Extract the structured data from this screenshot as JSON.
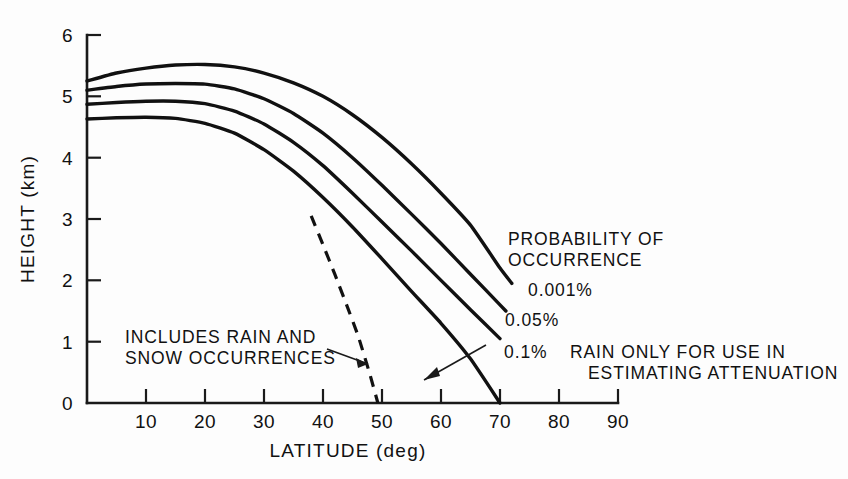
{
  "chart_data": {
    "type": "line",
    "title": "",
    "xlabel": "LATITUDE  (deg)",
    "ylabel": "HEIGHT  (km)",
    "xlim": [
      0,
      90
    ],
    "ylim": [
      0,
      6
    ],
    "xticks": [
      0,
      10,
      20,
      30,
      40,
      50,
      60,
      70,
      80,
      90
    ],
    "xtick_labels": [
      "0",
      "10",
      "20",
      "30",
      "40",
      "50",
      "60",
      "70",
      "80",
      "90"
    ],
    "yticks": [
      0,
      1,
      2,
      3,
      4,
      5,
      6
    ],
    "ytick_labels": [
      "0",
      "1",
      "2",
      "3",
      "4",
      "5",
      "6"
    ],
    "grid": false,
    "legend_position": "inline-right-annotations",
    "series": [
      {
        "name": "0.001%",
        "style": "solid",
        "x": [
          0,
          5,
          10,
          15,
          20,
          25,
          30,
          35,
          40,
          45,
          50,
          55,
          60,
          65,
          70,
          72
        ],
        "y": [
          5.25,
          5.38,
          5.46,
          5.51,
          5.52,
          5.48,
          5.38,
          5.22,
          5.0,
          4.7,
          4.33,
          3.9,
          3.42,
          2.9,
          2.2,
          1.95
        ]
      },
      {
        "name": "0.05%",
        "style": "solid",
        "x": [
          0,
          5,
          10,
          15,
          20,
          25,
          30,
          35,
          40,
          45,
          50,
          55,
          60,
          65,
          70,
          71
        ],
        "y": [
          5.1,
          5.16,
          5.2,
          5.21,
          5.2,
          5.12,
          4.96,
          4.72,
          4.4,
          4.0,
          3.55,
          3.08,
          2.6,
          2.1,
          1.6,
          1.5
        ]
      },
      {
        "name": "0.1%",
        "style": "solid",
        "x": [
          0,
          5,
          10,
          15,
          20,
          25,
          30,
          35,
          40,
          45,
          50,
          55,
          60,
          65,
          70
        ],
        "y": [
          4.87,
          4.9,
          4.92,
          4.92,
          4.88,
          4.76,
          4.55,
          4.25,
          3.87,
          3.42,
          2.95,
          2.48,
          2.0,
          1.52,
          1.05
        ]
      },
      {
        "name": "lowest",
        "style": "solid",
        "x": [
          0,
          5,
          10,
          15,
          20,
          25,
          30,
          35,
          40,
          45,
          50,
          55,
          60,
          65,
          70
        ],
        "y": [
          4.63,
          4.65,
          4.66,
          4.64,
          4.56,
          4.4,
          4.13,
          3.78,
          3.35,
          2.87,
          2.35,
          1.82,
          1.3,
          0.72,
          0.0
        ]
      },
      {
        "name": "includes-rain-and-snow",
        "style": "dashed",
        "x": [
          38,
          40,
          42,
          44,
          46,
          48,
          49.3
        ],
        "y": [
          3.05,
          2.58,
          2.1,
          1.6,
          1.08,
          0.45,
          0.0
        ]
      }
    ],
    "annotations": [
      {
        "id": "probability-of-occurrence",
        "text_lines": [
          "PROBABILITY OF",
          "OCCURRENCE"
        ]
      },
      {
        "id": "series-label-0001",
        "text": "0.001%"
      },
      {
        "id": "series-label-005",
        "text": "0.05%"
      },
      {
        "id": "series-label-01",
        "text": "0.1%"
      },
      {
        "id": "rain-snow-note",
        "text_lines": [
          "INCLUDES RAIN AND",
          "SNOW OCCURRENCES"
        ]
      },
      {
        "id": "rain-only-note",
        "text_lines": [
          "RAIN ONLY FOR USE IN",
          "ESTIMATING ATTENUATION"
        ]
      }
    ]
  },
  "axes": {
    "xlabel": "LATITUDE  (deg)",
    "ylabel": "HEIGHT  (km)",
    "xtick_labels": [
      "0",
      "10",
      "20",
      "30",
      "40",
      "50",
      "60",
      "70",
      "80",
      "90"
    ],
    "ytick_labels": [
      "0",
      "1",
      "2",
      "3",
      "4",
      "5",
      "6"
    ]
  },
  "annotations": {
    "probability_line1": "PROBABILITY OF",
    "probability_line2": "OCCURRENCE",
    "label_0001": "0.001%",
    "label_005": "0.05%",
    "label_01": "0.1%",
    "rain_snow_line1": "INCLUDES RAIN AND",
    "rain_snow_line2": "SNOW OCCURRENCES",
    "rain_only_line1": "RAIN ONLY FOR USE IN",
    "rain_only_line2": "ESTIMATING ATTENUATION"
  },
  "colors": {
    "ink": "#111111",
    "background": "#fdfdfd"
  }
}
